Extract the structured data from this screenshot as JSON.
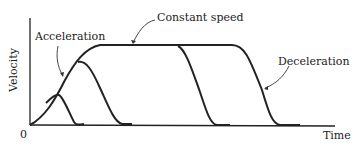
{
  "diagram": {
    "y_axis_label": "Velocity",
    "x_axis_label": "Time",
    "origin_label": "0",
    "annotations": {
      "acceleration": "Acceleration",
      "constant_speed": "Constant speed",
      "deceleration": "Deceleration"
    },
    "colors": {
      "line": "#222222",
      "background": "#ffffff"
    }
  }
}
